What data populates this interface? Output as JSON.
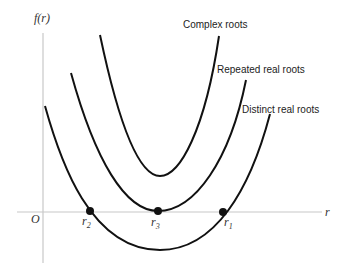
{
  "figure": {
    "y_axis_label": "f(r)",
    "x_axis_label": "r",
    "origin_label": "O",
    "curves": [
      {
        "id": "complex",
        "label": "Complex roots"
      },
      {
        "id": "repeated",
        "label": "Repeated real roots"
      },
      {
        "id": "distinct",
        "label": "Distinct real roots"
      }
    ],
    "roots": [
      {
        "id": "r2",
        "base": "r",
        "subscript": "2"
      },
      {
        "id": "r3",
        "base": "r",
        "subscript": "3"
      },
      {
        "id": "r1",
        "base": "r",
        "subscript": "1"
      }
    ]
  }
}
